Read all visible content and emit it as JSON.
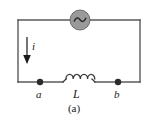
{
  "figure": {
    "caption": "(a)",
    "kind": "circuit-diagram",
    "background_color": "#ffffff",
    "wire_color": "#5a5a5a",
    "text_color": "#1a1a1a"
  },
  "labels": {
    "node_a": "a",
    "node_b": "b",
    "inductor": "L",
    "current": "i"
  },
  "components": {
    "ac_source": {
      "name": "ac-source",
      "symbol": "sine-wave",
      "fill_color": "#9a9a9a",
      "stroke_color": "#6e6e6e",
      "wave_color": "#3a3a3a",
      "center_x": 80,
      "center_y": 20,
      "radius": 10
    },
    "inductor": {
      "name": "inductor",
      "symbol": "coil",
      "loops": 4,
      "start_x": 62,
      "end_x": 96,
      "y": 82
    },
    "node_a_dot": {
      "name": "node-a",
      "x": 40,
      "y": 82,
      "radius": 3.2,
      "color": "#2a2a2a"
    },
    "node_b_dot": {
      "name": "node-b",
      "x": 118,
      "y": 82,
      "radius": 3.2,
      "color": "#2a2a2a"
    },
    "current_arrow": {
      "name": "current-arrow",
      "direction": "down",
      "x": 27,
      "y_start": 37,
      "y_end": 63,
      "color": "#2a2a2a"
    }
  },
  "geometry": {
    "loop_left_x": 18,
    "loop_right_x": 140,
    "loop_top_y": 20,
    "loop_bottom_y": 82
  }
}
